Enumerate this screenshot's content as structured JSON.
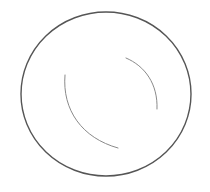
{
  "figure": {
    "colors": {
      "background": "#ffffff",
      "outline": "#555555",
      "highlight": "#8a8a8a"
    }
  }
}
